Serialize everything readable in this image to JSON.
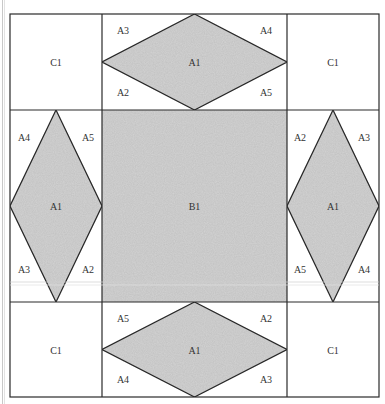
{
  "diagram": {
    "colors": {
      "fill": "#d3d3d3",
      "stroke": "#2a2a2a",
      "background": "#ffffff",
      "label": "#333333"
    },
    "grid": {
      "x": [
        10,
        102,
        287,
        379
      ],
      "y": [
        14,
        110,
        302,
        397
      ]
    },
    "cells": {
      "top_left": {
        "label": "C1"
      },
      "top_right": {
        "label": "C1"
      },
      "bottom_left": {
        "label": "C1"
      },
      "bottom_right": {
        "label": "C1"
      },
      "center": {
        "label": "B1"
      },
      "top_middle": {
        "diamond_label": "A1",
        "corners": {
          "top_left": "A3",
          "top_right": "A4",
          "bottom_left": "A2",
          "bottom_right": "A5"
        }
      },
      "middle_left": {
        "diamond_label": "A1",
        "corners": {
          "top_left": "A4",
          "top_right": "A5",
          "bottom_left": "A3",
          "bottom_right": "A2"
        }
      },
      "middle_right": {
        "diamond_label": "A1",
        "corners": {
          "top_left": "A2",
          "top_right": "A3",
          "bottom_left": "A5",
          "bottom_right": "A4"
        }
      },
      "bottom_middle": {
        "diamond_label": "A1",
        "corners": {
          "top_left": "A5",
          "top_right": "A2",
          "bottom_left": "A4",
          "bottom_right": "A3"
        }
      }
    }
  }
}
